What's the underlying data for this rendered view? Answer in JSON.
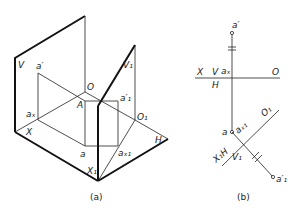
{
  "figure_a": {
    "caption": "(a)",
    "labels": {
      "V": "V",
      "a_prime": "a′",
      "O": "O",
      "A": "A",
      "a1_prime": "a′₁",
      "V1": "V₁",
      "ax": "aₓ",
      "O1": "O₁",
      "X": "X",
      "a": "a",
      "ax1": "aₓ₁",
      "H": "H",
      "X1": "X₁"
    }
  },
  "figure_b": {
    "caption": "(b)",
    "labels": {
      "a_prime": "a′",
      "X": "X",
      "V": "V",
      "ax": "aₓ",
      "O": "O",
      "H": "H",
      "a": "a",
      "ax1": "aₓ₁",
      "O1": "O₁",
      "X1H": "X₁H",
      "V1": "V₁",
      "a1_prime": "a′₁"
    }
  }
}
